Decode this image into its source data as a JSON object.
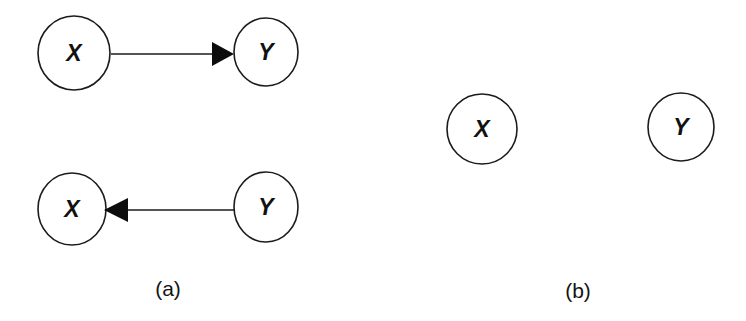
{
  "figure": {
    "background_color": "#ffffff",
    "ink_color": "#1b1b1b",
    "width": 746,
    "height": 321
  },
  "panels": [
    {
      "id": "panel-a",
      "caption": "(a)",
      "caption_x": 168,
      "caption_y": 296,
      "description": "Two directed graphs: X causes Y, and Y causes X",
      "graphs": [
        {
          "id": "graph-a-top",
          "nodes": [
            {
              "id": "a-top-x",
              "label": "X",
              "cx": 74,
              "cy": 53,
              "rx": 36,
              "ry": 37
            },
            {
              "id": "a-top-y",
              "label": "Y",
              "cx": 266,
              "cy": 52,
              "rx": 32,
              "ry": 34
            }
          ],
          "edges": [
            {
              "id": "edge-x-to-y",
              "from": "a-top-x",
              "to": "a-top-y",
              "direction": "right",
              "line_x1": 111,
              "line_x2": 229,
              "line_y": 54,
              "head_points": "212,42 234,54 212,66"
            }
          ]
        },
        {
          "id": "graph-a-bottom",
          "nodes": [
            {
              "id": "a-bot-x",
              "label": "X",
              "cx": 72,
              "cy": 209,
              "rx": 34,
              "ry": 36
            },
            {
              "id": "a-bot-y",
              "label": "Y",
              "cx": 266,
              "cy": 207,
              "rx": 32,
              "ry": 35
            }
          ],
          "edges": [
            {
              "id": "edge-y-to-x",
              "from": "a-bot-y",
              "to": "a-bot-x",
              "direction": "left",
              "line_x1": 126,
              "line_x2": 234,
              "line_y": 210,
              "head_points": "104,210 128,198 128,222"
            }
          ]
        }
      ]
    },
    {
      "id": "panel-b",
      "caption": "(b)",
      "caption_x": 578,
      "caption_y": 298,
      "description": "Two isolated nodes X and Y with no edges",
      "graphs": [
        {
          "id": "graph-b",
          "nodes": [
            {
              "id": "b-x",
              "label": "X",
              "cx": 482,
              "cy": 129,
              "rx": 35,
              "ry": 35
            },
            {
              "id": "b-y",
              "label": "Y",
              "cx": 681,
              "cy": 127,
              "rx": 33,
              "ry": 34
            }
          ],
          "edges": []
        }
      ]
    }
  ],
  "labels": {
    "node_x": "X",
    "node_y": "Y",
    "caption_a": "(a)",
    "caption_b": "(b)"
  }
}
